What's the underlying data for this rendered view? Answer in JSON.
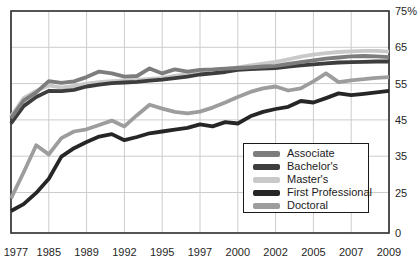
{
  "chart_data": {
    "type": "line",
    "title": "",
    "x_tick_labels": [
      "1977",
      "1985",
      "1989",
      "1992",
      "1995",
      "1997",
      "2000",
      "2002",
      "2005",
      "2007",
      "2009"
    ],
    "y_axis_tick_labels": [
      "75%",
      "65",
      "55",
      "45",
      "35",
      "25",
      "0"
    ],
    "y_axis_tick_values": [
      75,
      65,
      55,
      45,
      35,
      25,
      0
    ],
    "y_gridline_values": [
      65,
      55,
      45,
      35,
      25
    ],
    "ylim": [
      0,
      75
    ],
    "axis_note": "bottom label 0 sits on the frame; scale is truncated below 25",
    "grid": "on",
    "x_points_per_labeled_interval": 3,
    "series": [
      {
        "name": "Associate",
        "color": "#7d7d7d",
        "z": 5,
        "values": [
          45.5,
          50.3,
          52.6,
          55.7,
          55.2,
          55.6,
          56.8,
          58.3,
          57.8,
          56.9,
          57.1,
          59.2,
          57.8,
          58.9,
          58.3,
          58.8,
          58.9,
          59.1,
          59.3,
          59.5,
          59.7,
          59.9,
          60.4,
          60.9,
          61.4,
          61.9,
          62.2,
          62.5,
          62.6,
          62.5,
          62.3
        ]
      },
      {
        "name": "Bachelor's",
        "color": "#3d3d3d",
        "z": 4,
        "values": [
          44.0,
          48.8,
          51.3,
          53.0,
          52.9,
          53.3,
          54.2,
          54.7,
          55.1,
          55.3,
          55.5,
          55.8,
          56.1,
          56.5,
          56.9,
          57.5,
          57.8,
          58.2,
          58.8,
          59.0,
          59.1,
          59.3,
          59.7,
          60.0,
          60.3,
          60.6,
          60.8,
          60.9,
          61.0,
          61.1,
          61.1
        ]
      },
      {
        "name": "Master's",
        "color": "#c9c9c9",
        "z": 1,
        "values": [
          46.0,
          51.0,
          53.0,
          54.5,
          53.9,
          54.4,
          55.0,
          55.4,
          55.7,
          55.9,
          56.0,
          56.3,
          56.6,
          57.1,
          57.6,
          58.3,
          58.6,
          59.0,
          59.5,
          60.0,
          60.5,
          61.0,
          61.7,
          62.4,
          63.0,
          63.4,
          63.7,
          63.9,
          64.0,
          64.0,
          63.8
        ]
      },
      {
        "name": "First Professional",
        "color": "#262626",
        "z": 3,
        "values": [
          19.9,
          21.8,
          24.9,
          28.8,
          34.9,
          37.2,
          38.9,
          40.4,
          41.1,
          39.4,
          40.3,
          41.3,
          41.8,
          42.3,
          42.8,
          43.8,
          43.2,
          44.4,
          44.0,
          46.0,
          47.2,
          48.0,
          48.6,
          50.2,
          49.8,
          51.0,
          52.3,
          51.8,
          52.2,
          52.6,
          53.0
        ]
      },
      {
        "name": "Doctoral",
        "color": "#9d9d9d",
        "z": 2,
        "values": [
          23.4,
          30.5,
          38.0,
          35.5,
          40.0,
          41.8,
          42.4,
          43.6,
          44.8,
          43.2,
          46.3,
          49.2,
          48.1,
          47.2,
          46.8,
          47.3,
          48.4,
          49.8,
          51.3,
          52.7,
          53.7,
          54.2,
          53.1,
          53.7,
          55.6,
          57.8,
          55.4,
          55.9,
          56.2,
          56.6,
          56.8
        ]
      }
    ],
    "legend": {
      "position": "inside bottom-right",
      "items": [
        "Associate",
        "Bachelor's",
        "Master's",
        "First Professional",
        "Doctoral"
      ]
    }
  },
  "colors": {
    "background": "#ffffff",
    "gridline": "#cccccc",
    "frame": "#2b2b2b",
    "tick_text": "#1f1f1f",
    "legend_border": "#1a1a1a",
    "legend_text": "#1c1c1c"
  }
}
